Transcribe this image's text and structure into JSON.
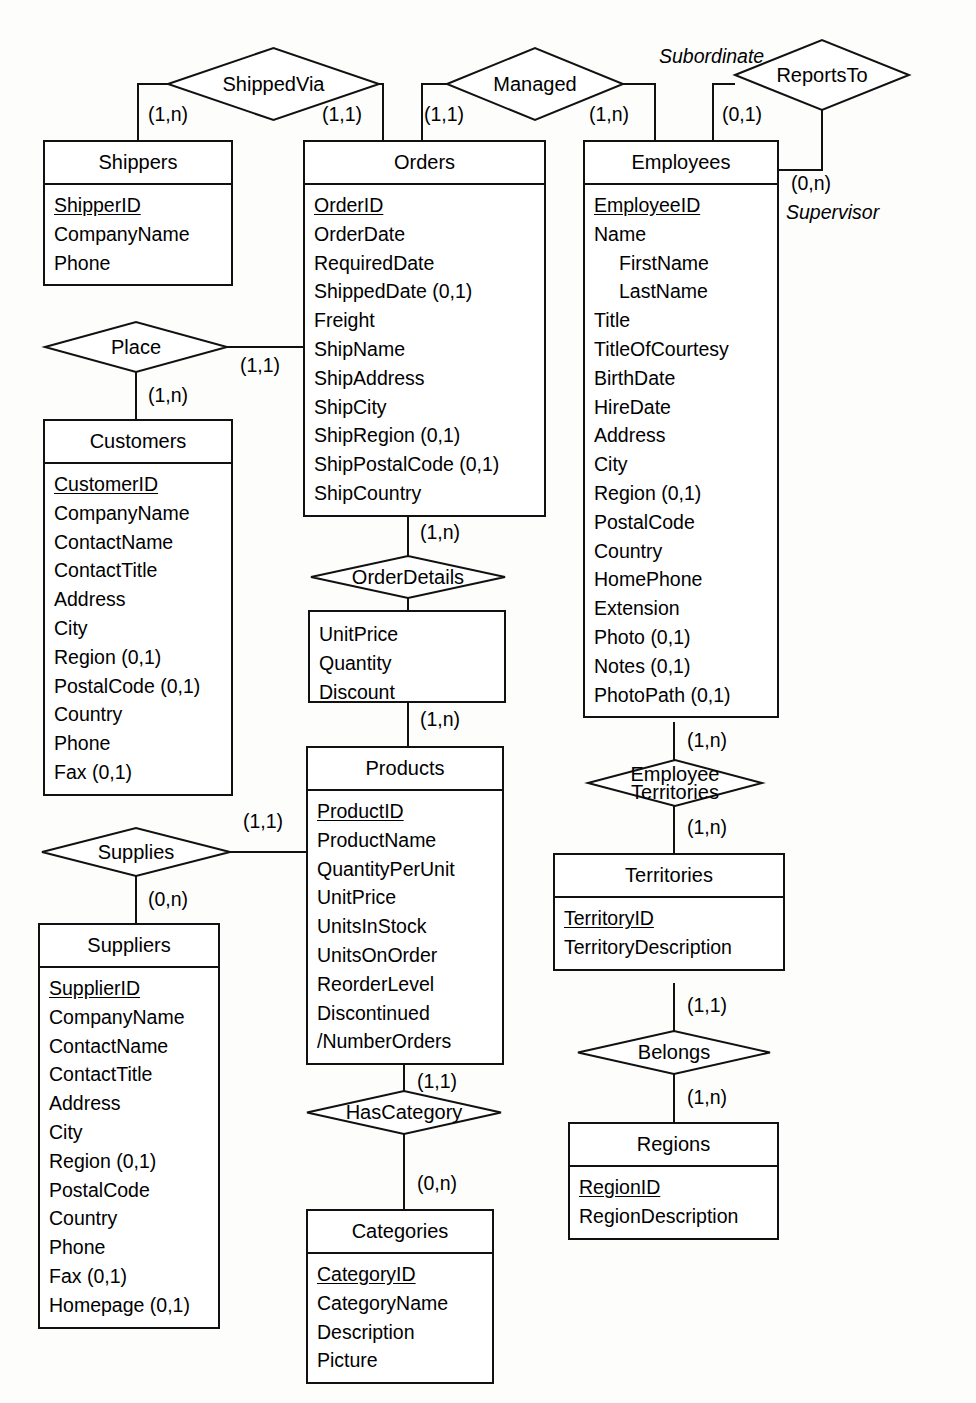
{
  "diagram": {
    "notation": "min-max (Merise) cardinality",
    "entities": [
      {
        "id": "shippers",
        "name": "Shippers",
        "attributes": [
          {
            "label": "ShipperID",
            "key": true
          },
          {
            "label": "CompanyName",
            "key": false
          },
          {
            "label": "Phone",
            "key": false
          }
        ]
      },
      {
        "id": "orders",
        "name": "Orders",
        "attributes": [
          {
            "label": "OrderID",
            "key": true
          },
          {
            "label": "OrderDate",
            "key": false
          },
          {
            "label": "RequiredDate",
            "key": false
          },
          {
            "label": "ShippedDate (0,1)",
            "key": false
          },
          {
            "label": "Freight",
            "key": false
          },
          {
            "label": "ShipName",
            "key": false
          },
          {
            "label": "ShipAddress",
            "key": false
          },
          {
            "label": "ShipCity",
            "key": false
          },
          {
            "label": "ShipRegion (0,1)",
            "key": false
          },
          {
            "label": "ShipPostalCode (0,1)",
            "key": false
          },
          {
            "label": "ShipCountry",
            "key": false
          }
        ]
      },
      {
        "id": "employees",
        "name": "Employees",
        "attributes": [
          {
            "label": "EmployeeID",
            "key": true
          },
          {
            "label": "Name",
            "key": false
          },
          {
            "label": "FirstName",
            "key": false,
            "indent": true
          },
          {
            "label": "LastName",
            "key": false,
            "indent": true
          },
          {
            "label": "Title",
            "key": false
          },
          {
            "label": "TitleOfCourtesy",
            "key": false
          },
          {
            "label": "BirthDate",
            "key": false
          },
          {
            "label": "HireDate",
            "key": false
          },
          {
            "label": "Address",
            "key": false
          },
          {
            "label": "City",
            "key": false
          },
          {
            "label": "Region (0,1)",
            "key": false
          },
          {
            "label": "PostalCode",
            "key": false
          },
          {
            "label": "Country",
            "key": false
          },
          {
            "label": "HomePhone",
            "key": false
          },
          {
            "label": "Extension",
            "key": false
          },
          {
            "label": "Photo (0,1)",
            "key": false
          },
          {
            "label": "Notes (0,1)",
            "key": false
          },
          {
            "label": "PhotoPath (0,1)",
            "key": false
          }
        ]
      },
      {
        "id": "customers",
        "name": "Customers",
        "attributes": [
          {
            "label": "CustomerID",
            "key": true
          },
          {
            "label": "CompanyName",
            "key": false
          },
          {
            "label": "ContactName",
            "key": false
          },
          {
            "label": "ContactTitle",
            "key": false
          },
          {
            "label": "Address",
            "key": false
          },
          {
            "label": "City",
            "key": false
          },
          {
            "label": "Region (0,1)",
            "key": false
          },
          {
            "label": "PostalCode (0,1)",
            "key": false
          },
          {
            "label": "Country",
            "key": false
          },
          {
            "label": "Phone",
            "key": false
          },
          {
            "label": "Fax (0,1)",
            "key": false
          }
        ]
      },
      {
        "id": "products",
        "name": "Products",
        "attributes": [
          {
            "label": "ProductID",
            "key": true
          },
          {
            "label": "ProductName",
            "key": false
          },
          {
            "label": "QuantityPerUnit",
            "key": false
          },
          {
            "label": "UnitPrice",
            "key": false
          },
          {
            "label": "UnitsInStock",
            "key": false
          },
          {
            "label": "UnitsOnOrder",
            "key": false
          },
          {
            "label": "ReorderLevel",
            "key": false
          },
          {
            "label": "Discontinued",
            "key": false
          },
          {
            "label": "/NumberOrders",
            "key": false
          }
        ]
      },
      {
        "id": "suppliers",
        "name": "Suppliers",
        "attributes": [
          {
            "label": "SupplierID",
            "key": true
          },
          {
            "label": "CompanyName",
            "key": false
          },
          {
            "label": "ContactName",
            "key": false
          },
          {
            "label": "ContactTitle",
            "key": false
          },
          {
            "label": "Address",
            "key": false
          },
          {
            "label": "City",
            "key": false
          },
          {
            "label": "Region (0,1)",
            "key": false
          },
          {
            "label": "PostalCode",
            "key": false
          },
          {
            "label": "Country",
            "key": false
          },
          {
            "label": "Phone",
            "key": false
          },
          {
            "label": "Fax (0,1)",
            "key": false
          },
          {
            "label": "Homepage (0,1)",
            "key": false
          }
        ]
      },
      {
        "id": "categories",
        "name": "Categories",
        "attributes": [
          {
            "label": "CategoryID",
            "key": true
          },
          {
            "label": "CategoryName",
            "key": false
          },
          {
            "label": "Description",
            "key": false
          },
          {
            "label": "Picture",
            "key": false
          }
        ]
      },
      {
        "id": "territories",
        "name": "Territories",
        "attributes": [
          {
            "label": "TerritoryID",
            "key": true
          },
          {
            "label": "TerritoryDescription",
            "key": false
          }
        ]
      },
      {
        "id": "regions",
        "name": "Regions",
        "attributes": [
          {
            "label": "RegionID",
            "key": true
          },
          {
            "label": "RegionDescription",
            "key": false
          }
        ]
      }
    ],
    "relationships": [
      {
        "id": "shippedvia",
        "label": "ShippedVia",
        "line2": ""
      },
      {
        "id": "managed",
        "label": "Managed",
        "line2": ""
      },
      {
        "id": "reportsto",
        "label": "ReportsTo",
        "line2": ""
      },
      {
        "id": "place",
        "label": "Place",
        "line2": ""
      },
      {
        "id": "orderdetails",
        "label": "OrderDetails",
        "line2": ""
      },
      {
        "id": "supplies",
        "label": "Supplies",
        "line2": ""
      },
      {
        "id": "hascategory",
        "label": "HasCategory",
        "line2": ""
      },
      {
        "id": "employeeterritories",
        "label": "Employee",
        "line2": "Territories"
      },
      {
        "id": "belongs",
        "label": "Belongs",
        "line2": ""
      }
    ],
    "relationship_attributes": {
      "orderdetails": [
        {
          "label": "UnitPrice"
        },
        {
          "label": "Quantity"
        },
        {
          "label": "Discount"
        }
      ]
    },
    "cardinalities": {
      "shippedvia_shippers": "(1,n)",
      "shippedvia_orders": "(1,1)",
      "managed_orders": "(1,1)",
      "managed_employees": "(1,n)",
      "reportsto_subordinate": "(0,1)",
      "reportsto_supervisor": "(0,n)",
      "place_orders": "(1,1)",
      "place_customers": "(1,n)",
      "orderdetails_orders": "(1,n)",
      "orderdetails_products": "(1,n)",
      "supplies_products": "(1,1)",
      "supplies_suppliers": "(0,n)",
      "hascategory_products": "(1,1)",
      "hascategory_categories": "(0,n)",
      "empterr_employees": "(1,n)",
      "empterr_territories": "(1,n)",
      "belongs_territories": "(1,1)",
      "belongs_regions": "(1,n)"
    },
    "roles": {
      "subordinate": "Subordinate",
      "supervisor": "Supervisor"
    }
  }
}
